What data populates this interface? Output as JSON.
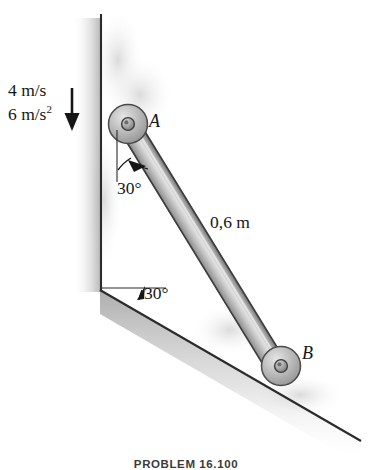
{
  "figure": {
    "title_caption": "PROBLEM 16.100",
    "labels": {
      "velocity": "4 m/s",
      "acceleration_value": "6 m/s",
      "acceleration_exponent": "2",
      "bar_length": "0,6 m",
      "angle_bar_from_vertical": "30°",
      "angle_incline": "30°",
      "point_a": "A",
      "point_b": "B"
    },
    "icons": {
      "velocity_arrow": "down-arrow-icon",
      "angle_arc_top": "angle-arc-icon",
      "angle_arc_bottom": "angle-arc-icon",
      "roller_a": "roller-wheel-icon",
      "roller_b": "roller-wheel-icon",
      "wall": "vertical-wall-icon",
      "incline": "inclined-surface-icon",
      "bar": "rigid-bar-icon"
    },
    "colors": {
      "ink": "#161616",
      "line": "#2b2b2b",
      "bar_fill": "#b9b9b9",
      "bar_highlight": "#d8d8d8",
      "roller_fill": "#b4b4b4",
      "hatch": "#bdbdbd",
      "background": "#ffffff"
    }
  }
}
